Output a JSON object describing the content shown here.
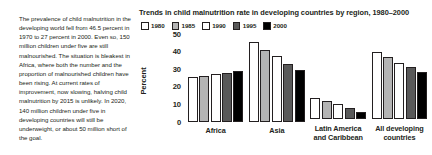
{
  "narrative": {
    "text": "The prevalence of child malnutrition in the developing world fell from 46.5 percent in 1970 to 27 percent in 2000. Even so, 150 million children under five are still malnourished. The situation is bleakest in Africa, where both the number and the proportion of malnourished children have been rising. At current rates of improvement, now slowing, halving child malnutrition by 2015 is unlikely. In 2020, 140 million children under five in developing countries will still be underweight, or about 50 million short of the goal."
  },
  "chart_data": {
    "type": "bar",
    "title": "Trends in child malnutrition rate in developing countries by region, 1980–2000",
    "xlabel": "",
    "ylabel": "Percent",
    "ylim": [
      0,
      50
    ],
    "yticks": [
      "0",
      "10",
      "20",
      "30",
      "40",
      "50"
    ],
    "grid": false,
    "legend_position": "top-left",
    "categories": [
      "Africa",
      "Asia",
      "Latin America\nand Caribbean",
      "All developing\ncountries"
    ],
    "series": [
      {
        "name": "1980",
        "color": "#ffffff",
        "values": [
          25.5,
          45.0,
          12.0,
          38.0
        ]
      },
      {
        "name": "1985",
        "color": "#b4b4b4",
        "values": [
          26.0,
          40.5,
          10.0,
          35.0
        ]
      },
      {
        "name": "1990",
        "color": "#ffffff",
        "values": [
          27.0,
          37.0,
          8.5,
          32.0
        ]
      },
      {
        "name": "1995",
        "color": "#595959",
        "values": [
          27.5,
          32.5,
          6.5,
          29.5
        ]
      },
      {
        "name": "2000",
        "color": "#000000",
        "values": [
          28.5,
          29.0,
          4.0,
          26.5
        ]
      }
    ]
  }
}
